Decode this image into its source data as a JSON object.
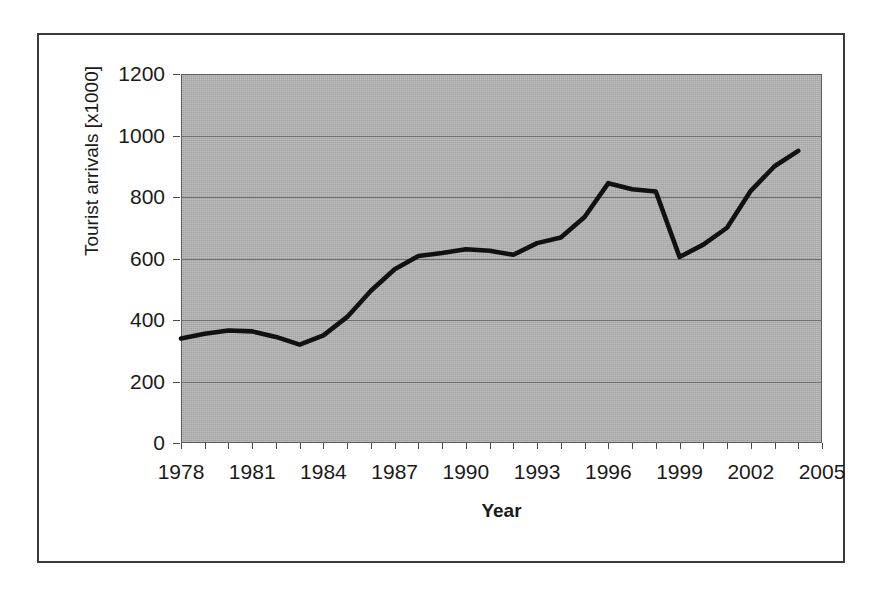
{
  "figure": {
    "background_color": "#ffffff",
    "frame_color": "#3a3a3a",
    "plot_background_color": "#b2b2b2",
    "gridline_color": "#6f6f6f",
    "line_color": "#111111"
  },
  "chart_data": {
    "type": "line",
    "title": "",
    "subtitle": "",
    "xlabel": "Year",
    "ylabel": "Tourist arrivals [x1000]",
    "xlim": [
      1978,
      2005
    ],
    "ylim": [
      0,
      1200
    ],
    "grid": true,
    "legend": null,
    "legend_position": "none",
    "x_ticks": [
      1978,
      1981,
      1984,
      1987,
      1990,
      1993,
      1996,
      1999,
      2002,
      2005
    ],
    "x_tick_labels": [
      "1978",
      "1981",
      "1984",
      "1987",
      "1990",
      "1993",
      "1996",
      "1999",
      "2002",
      "2005"
    ],
    "x_minor_tick_step": 1,
    "y_ticks": [
      0,
      200,
      400,
      600,
      800,
      1000,
      1200
    ],
    "y_tick_labels": [
      "0",
      "200",
      "400",
      "600",
      "800",
      "1000",
      "1200"
    ],
    "x": [
      1978,
      1979,
      1980,
      1981,
      1982,
      1983,
      1984,
      1985,
      1986,
      1987,
      1988,
      1989,
      1990,
      1991,
      1992,
      1993,
      1994,
      1995,
      1996,
      1997,
      1998,
      1999,
      2000,
      2001,
      2002,
      2003,
      2004
    ],
    "values": [
      340,
      355,
      366,
      363,
      345,
      320,
      350,
      410,
      495,
      565,
      608,
      618,
      630,
      625,
      612,
      650,
      668,
      735,
      845,
      825,
      818,
      605,
      645,
      700,
      820,
      900,
      950
    ],
    "series": [
      {
        "name": "Tourist arrivals",
        "values": [
          340,
          355,
          366,
          363,
          345,
          320,
          350,
          410,
          495,
          565,
          608,
          618,
          630,
          625,
          612,
          650,
          668,
          735,
          845,
          825,
          818,
          605,
          645,
          700,
          820,
          900,
          950
        ]
      }
    ],
    "annotations": []
  }
}
